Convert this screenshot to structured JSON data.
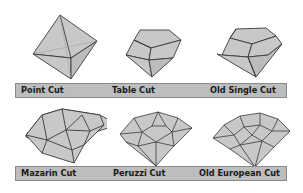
{
  "colors": {
    "facet_fill": "#c8c8c8",
    "facet_stroke": "#3a3a3a",
    "label_bar": "#bdbdbd",
    "label_border": "#8a8a8a",
    "text": "#1a1a1a"
  },
  "rows": [
    {
      "cuts": [
        {
          "name": "Point Cut",
          "icon": "point-cut-diamond"
        },
        {
          "name": "Table Cut",
          "icon": "table-cut-diamond"
        },
        {
          "name": "Old Single Cut",
          "icon": "old-single-cut-diamond"
        }
      ]
    },
    {
      "cuts": [
        {
          "name": "Mazarin Cut",
          "icon": "mazarin-cut-diamond"
        },
        {
          "name": "Peruzzi Cut",
          "icon": "peruzzi-cut-diamond"
        },
        {
          "name": "Old European Cut",
          "icon": "old-european-cut-diamond"
        }
      ]
    }
  ]
}
